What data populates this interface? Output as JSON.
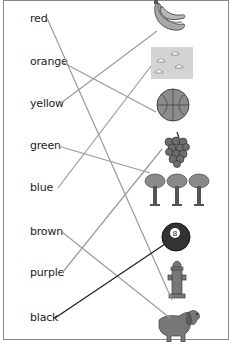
{
  "worksheet": {
    "words": [
      {
        "label": "red",
        "y": 12
      },
      {
        "label": "orange",
        "y": 55
      },
      {
        "label": "yellow",
        "y": 97
      },
      {
        "label": "green",
        "y": 139
      },
      {
        "label": "blue",
        "y": 181
      },
      {
        "label": "brown",
        "y": 225
      },
      {
        "label": "purple",
        "y": 266
      },
      {
        "label": "black",
        "y": 311
      }
    ],
    "pictures": [
      "banana-icon",
      "sky-icon",
      "basketball-icon",
      "grapes-icon",
      "trees-icon",
      "eight-ball-icon",
      "fire-hydrant-icon",
      "dog-icon"
    ],
    "eight_ball_number": "8",
    "matches": [
      {
        "word": "red",
        "picture": "fire-hydrant"
      },
      {
        "word": "orange",
        "picture": "basketball"
      },
      {
        "word": "yellow",
        "picture": "banana"
      },
      {
        "word": "green",
        "picture": "trees"
      },
      {
        "word": "blue",
        "picture": "sky"
      },
      {
        "word": "brown",
        "picture": "dog"
      },
      {
        "word": "purple",
        "picture": "grapes"
      },
      {
        "word": "black",
        "picture": "eight-ball"
      }
    ],
    "colors": {
      "line": "#9a9a9a",
      "line_dark": "#222222",
      "border": "#8a8a8a"
    }
  }
}
